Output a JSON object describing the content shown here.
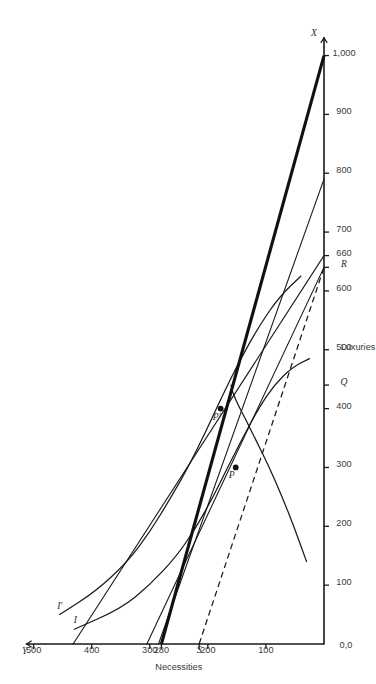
{
  "figure": {
    "orientation_degrees": -90,
    "background_color": "#ffffff",
    "line_color": "#1a1a1a"
  },
  "chart_data": {
    "type": "line",
    "title": "",
    "subtitle": "",
    "xlabel": "Luxuries",
    "ylabel": "Necessities",
    "xlim": [
      0,
      1040
    ],
    "ylim": [
      0,
      520
    ],
    "grid": false,
    "legend_position": "inline-curve-labels",
    "origin_label": "0,0",
    "x_axis_end_label": "X",
    "y_axis_end_label": "Y",
    "x_ticks": [
      100,
      200,
      300,
      400,
      500,
      600,
      660,
      700,
      800,
      900,
      1000
    ],
    "x_ticklabels": [
      "100",
      "200",
      "300",
      "400",
      "500",
      "600",
      "660",
      "700",
      "800",
      "900",
      "1,000"
    ],
    "y_ticks": [
      100,
      200,
      280,
      300,
      400,
      500
    ],
    "y_ticklabels": [
      "100",
      "200",
      "280",
      "300",
      "400",
      "500"
    ],
    "special_axis_marks": [
      {
        "name": "Q",
        "axis": "x",
        "value": 440,
        "label": "Q"
      },
      {
        "name": "R",
        "axis": "x",
        "value": 640,
        "label": "R"
      },
      {
        "name": "S",
        "axis": "y",
        "value": 215,
        "label": "S"
      }
    ],
    "annotations": [
      {
        "label": "P",
        "x": 300,
        "y": 152,
        "desc": "tangency point on curve I"
      },
      {
        "label": "P'",
        "x": 400,
        "y": 178,
        "desc": "tangency point on curve I-prime"
      },
      {
        "label": "I",
        "x": 35,
        "y": 428,
        "desc": "lower indifference curve label"
      },
      {
        "label": "I'",
        "x": 60,
        "y": 455,
        "desc": "upper indifference curve label"
      }
    ],
    "series": [
      {
        "name": "I",
        "kind": "indifference-curve",
        "style": "solid",
        "points": [
          [
            25,
            430
          ],
          [
            60,
            350
          ],
          [
            100,
            300
          ],
          [
            150,
            253
          ],
          [
            200,
            219
          ],
          [
            250,
            191
          ],
          [
            300,
            166
          ],
          [
            350,
            140
          ],
          [
            400,
            113
          ],
          [
            440,
            86
          ],
          [
            470,
            55
          ],
          [
            485,
            25
          ]
        ]
      },
      {
        "name": "I'",
        "kind": "indifference-curve",
        "style": "solid",
        "points": [
          [
            50,
            455
          ],
          [
            90,
            392
          ],
          [
            140,
            338
          ],
          [
            190,
            300
          ],
          [
            250,
            263
          ],
          [
            300,
            234
          ],
          [
            360,
            204
          ],
          [
            420,
            176
          ],
          [
            480,
            146
          ],
          [
            540,
            112
          ],
          [
            590,
            77
          ],
          [
            625,
            40
          ]
        ]
      },
      {
        "name": "Q-curve",
        "kind": "transformation-curve",
        "style": "solid",
        "points": [
          [
            140,
            30
          ],
          [
            200,
            52
          ],
          [
            250,
            72
          ],
          [
            300,
            94
          ],
          [
            340,
            114
          ],
          [
            380,
            134
          ],
          [
            410,
            150
          ],
          [
            430,
            158
          ],
          [
            440,
            160
          ]
        ]
      },
      {
        "name": "budget-line-1",
        "kind": "price-line",
        "style": "solid",
        "points": [
          [
            0,
            305
          ],
          [
            640,
            0
          ]
        ]
      },
      {
        "name": "budget-line-2",
        "kind": "price-line",
        "style": "solid",
        "points": [
          [
            0,
            285
          ],
          [
            790,
            0
          ]
        ]
      },
      {
        "name": "budget-line-3",
        "kind": "price-line",
        "style": "solid",
        "points": [
          [
            0,
            432
          ],
          [
            660,
            0
          ]
        ]
      },
      {
        "name": "budget-line-bold",
        "kind": "price-line-bold",
        "style": "bold",
        "points": [
          [
            0,
            280
          ],
          [
            1000,
            0
          ]
        ]
      },
      {
        "name": "budget-line-dashed",
        "kind": "price-line-dashed",
        "style": "dashed",
        "points": [
          [
            0,
            215
          ],
          [
            640,
            0
          ]
        ]
      }
    ]
  }
}
